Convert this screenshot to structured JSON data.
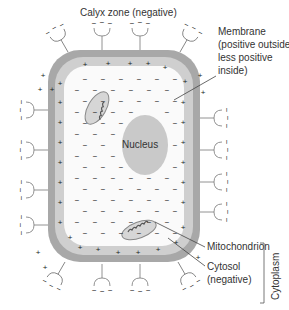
{
  "diagram": {
    "labels": {
      "calyx": "Calyx zone (negative)",
      "membrane": [
        "Membrane",
        "(positive outside,",
        "less positive",
        "inside)"
      ],
      "nucleus": "Nucleus",
      "mitochondrion": "Mitochondrion",
      "cytosol": [
        "Cytosol",
        "(negative)"
      ],
      "cytoplasm": "Cytoplasm"
    },
    "colors": {
      "membrane_outer": "#a8a8a8",
      "membrane_inner": "#cfcfcf",
      "cytosol": "#fafafa",
      "nucleus": "#c9c9c9",
      "mito_fill": "#d6d6d6",
      "line": "#555555"
    },
    "symbols": {
      "positive": "+",
      "negative": "−"
    }
  }
}
